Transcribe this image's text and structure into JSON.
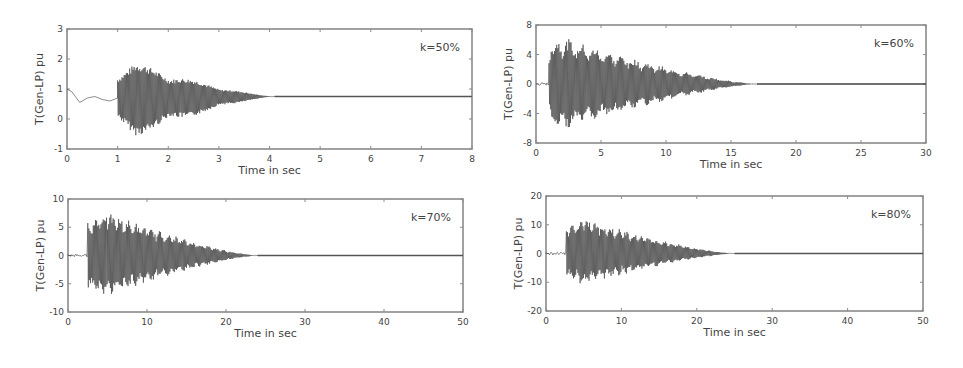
{
  "figure": {
    "background": "#ffffff",
    "trace_color": "#2b2b2b",
    "axis_color": "#8a8a8a"
  },
  "chart_data": [
    {
      "type": "line",
      "title": "",
      "annotation": "k=50%",
      "xlabel": "Time in sec",
      "ylabel": "T(Gen-LP) pu",
      "xlim": [
        0,
        8
      ],
      "ylim": [
        -1,
        3
      ],
      "xticks": [
        "0",
        "1",
        "2",
        "3",
        "4",
        "5",
        "6",
        "7",
        "8"
      ],
      "yticks": [
        "-1",
        "0",
        "1",
        "2",
        "3"
      ],
      "grid": false,
      "legend": null,
      "series": [
        {
          "name": "T(Gen-LP)",
          "description": "Pre-disturbance decaying swing from 1.0 to ~0.7, oscillation burst starting at t=1s, peak envelope ~[-0.6, 1.9] near t=1.3s, decaying to steady 0.75 pu by t=4s",
          "steady_value": 0.75,
          "onset_time": 1.0,
          "peak_time": 1.35,
          "peak_max": 1.9,
          "peak_min": -0.6,
          "settle_time": 4.1,
          "pre_points": [
            [
              0,
              1.0
            ],
            [
              0.1,
              0.9
            ],
            [
              0.25,
              0.55
            ],
            [
              0.4,
              0.7
            ],
            [
              0.55,
              0.75
            ],
            [
              0.7,
              0.65
            ],
            [
              0.85,
              0.6
            ],
            [
              1.0,
              0.7
            ]
          ]
        }
      ]
    },
    {
      "type": "line",
      "title": "",
      "annotation": "k=60%",
      "xlabel": "Time in sec",
      "ylabel": "T(Gen-LP) pu",
      "xlim": [
        0,
        30
      ],
      "ylim": [
        -8,
        8
      ],
      "xticks": [
        "0",
        "5",
        "10",
        "15",
        "20",
        "25",
        "30"
      ],
      "yticks": [
        "-8",
        "-4",
        "0",
        "4",
        "8"
      ],
      "grid": false,
      "legend": null,
      "series": [
        {
          "name": "T(Gen-LP)",
          "description": "Small oscillation ~0 until t≈1s, burst with peak envelope ~[-6.5, 6.5] near t=1.5-2s, decaying to ~0 by t≈17s",
          "steady_value": 0,
          "onset_time": 1.0,
          "peak_time": 1.8,
          "peak_max": 6.5,
          "peak_min": -6.5,
          "settle_time": 17
        }
      ]
    },
    {
      "type": "line",
      "title": "",
      "annotation": "k=70%",
      "xlabel": "Time in sec",
      "ylabel": "T(Gen-LP) pu",
      "xlim": [
        0,
        50
      ],
      "ylim": [
        -10,
        10
      ],
      "xticks": [
        "0",
        "10",
        "20",
        "30",
        "40",
        "50"
      ],
      "yticks": [
        "-10",
        "-5",
        "0",
        "5",
        "10"
      ],
      "grid": false,
      "legend": null,
      "series": [
        {
          "name": "T(Gen-LP)",
          "description": "Small oscillation ~0 until t≈2.5s, burst with peak envelope ~[-7.5, 8] near t=4-5s, decaying to ~0 by t≈24s",
          "steady_value": 0,
          "onset_time": 2.5,
          "peak_time": 4.5,
          "peak_max": 8,
          "peak_min": -7.5,
          "settle_time": 24
        }
      ]
    },
    {
      "type": "line",
      "title": "",
      "annotation": "k=80%",
      "xlabel": "Time in sec",
      "ylabel": "T(Gen-LP) pu",
      "xlim": [
        0,
        50
      ],
      "ylim": [
        -20,
        20
      ],
      "xticks": [
        "0",
        "10",
        "20",
        "30",
        "40",
        "50"
      ],
      "yticks": [
        "-20",
        "-10",
        "0",
        "10",
        "20"
      ],
      "grid": false,
      "legend": null,
      "series": [
        {
          "name": "T(Gen-LP)",
          "description": "Small oscillation ~0 until t≈2.7s, burst with peak envelope ~[-11, 12.5] near t=4-6s, decaying to ~0 by t≈25s",
          "steady_value": 0,
          "onset_time": 2.7,
          "peak_time": 5,
          "peak_max": 12.5,
          "peak_min": -11,
          "settle_time": 25
        }
      ]
    }
  ],
  "layout": [
    {
      "left": 67,
      "top": 29,
      "right": 472,
      "bottom": 149
    },
    {
      "left": 536,
      "top": 25,
      "right": 926,
      "bottom": 143
    },
    {
      "left": 68,
      "top": 199,
      "right": 463,
      "bottom": 312
    },
    {
      "left": 546,
      "top": 196,
      "right": 923,
      "bottom": 311
    }
  ]
}
